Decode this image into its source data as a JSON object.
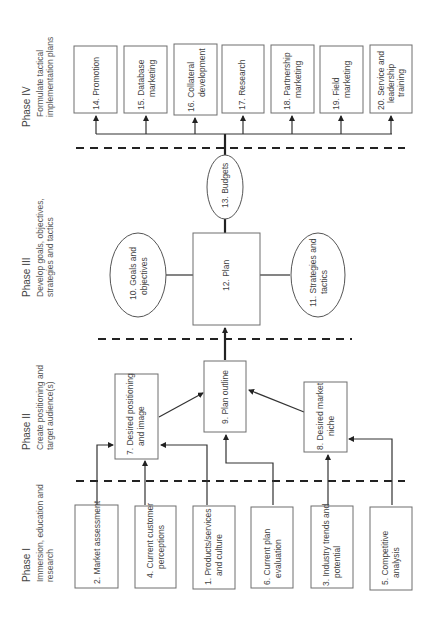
{
  "phases": [
    {
      "title": "Phase I",
      "desc_line1": "Immersion, education and",
      "desc_line2": "research"
    },
    {
      "title": "Phase II",
      "desc_line1": "Create positioning and",
      "desc_line2": "target audience(s)"
    },
    {
      "title": "Phase III",
      "desc_line1": "Develop goals, objectives,",
      "desc_line2": "strategies and tactics"
    },
    {
      "title": "Phase IV",
      "desc_line1": "Formulate tactical",
      "desc_line2": "implementation plans"
    }
  ],
  "nodes": {
    "n1": {
      "line1": "1. Products/services",
      "line2": "and culture"
    },
    "n2": {
      "line1": "2. Market assessment",
      "line2": ""
    },
    "n3": {
      "line1": "3. Industry trends and",
      "line2": "potential"
    },
    "n4": {
      "line1": "4. Current customer",
      "line2": "perceptions"
    },
    "n5": {
      "line1": "5. Competitive",
      "line2": "analysis"
    },
    "n6": {
      "line1": "6. Current plan",
      "line2": "evaluation"
    },
    "n7": {
      "line1": "7. Desired positioning",
      "line2": "and image"
    },
    "n8": {
      "line1": "8. Desired market",
      "line2": "niche"
    },
    "n9": {
      "line1": "9. Plan outline",
      "line2": ""
    },
    "n10": {
      "line1": "10. Goals and",
      "line2": "objectives"
    },
    "n11": {
      "line1": "11. Strategies and",
      "line2": "tactics"
    },
    "n12": {
      "line1": "12. Plan",
      "line2": ""
    },
    "n13": {
      "line1": "13. Budgets",
      "line2": ""
    },
    "n14": {
      "line1": "14. Promotion",
      "line2": ""
    },
    "n15": {
      "line1": "15. Database",
      "line2": "marketing"
    },
    "n16": {
      "line1": "16. Collateral",
      "line2": "development"
    },
    "n17": {
      "line1": "17. Research",
      "line2": ""
    },
    "n18": {
      "line1": "18. Partnership",
      "line2": "marketing"
    },
    "n19": {
      "line1": "19. Field",
      "line2": "marketing"
    },
    "n20": {
      "line1": "20. Service and",
      "line2": "leadership",
      "line3": "training"
    }
  }
}
